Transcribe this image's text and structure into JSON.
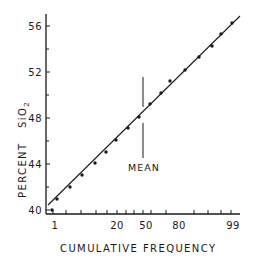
{
  "chart_data": {
    "type": "scatter",
    "title": "",
    "xlabel": "CUMULATIVE FREQUENCY",
    "ylabel": "PERCENT SiO2",
    "ylabel_main": "PERCENT",
    "ylabel_chem": "SiO",
    "ylabel_sub": "2",
    "x_scale": "probability",
    "x_tick_labels": [
      "1",
      "20",
      "50",
      "80",
      "99"
    ],
    "y_tick_labels": [
      "40",
      "44",
      "48",
      "52",
      "56"
    ],
    "ylim": [
      39,
      57
    ],
    "xlim": [
      0.5,
      99.5
    ],
    "grid": false,
    "legend": null,
    "annotation": {
      "text": "MEAN",
      "x": 50
    },
    "series": [
      {
        "name": "samples",
        "marker": "dot",
        "x": [
          1,
          3,
          6,
          10,
          15,
          21,
          28,
          36,
          44,
          52,
          60,
          67,
          76,
          84,
          90,
          94,
          97.5
        ],
        "y": [
          40.0,
          41.0,
          42.0,
          43.0,
          44.1,
          45.0,
          46.0,
          47.1,
          48.0,
          49.1,
          50.1,
          51.1,
          52.1,
          53.2,
          54.2,
          55.2,
          56.1
        ]
      }
    ],
    "fit_line": {
      "from": {
        "x": 0.8,
        "y": 40.4
      },
      "to": {
        "x": 99,
        "y": 56.9
      }
    }
  },
  "points_px": [
    [
      52,
      210
    ],
    [
      57,
      199
    ],
    [
      70,
      187
    ],
    [
      82,
      175
    ],
    [
      95,
      163
    ],
    [
      106,
      152
    ],
    [
      116,
      140
    ],
    [
      128,
      128
    ],
    [
      139,
      117
    ],
    [
      150,
      104
    ],
    [
      161,
      93
    ],
    [
      170,
      81
    ],
    [
      185,
      70
    ],
    [
      199,
      57
    ],
    [
      212,
      46
    ],
    [
      221,
      34
    ],
    [
      232,
      23
    ]
  ],
  "y_ticks_px": [
    {
      "label": "40",
      "y": 210
    },
    {
      "label": "44",
      "y": 174
    },
    {
      "label": "48",
      "y": 117
    },
    {
      "label": "52",
      "y": 72
    },
    {
      "label": "56",
      "y": 26
    }
  ],
  "x_ticks_px": [
    {
      "label": "1",
      "x": 53
    },
    {
      "label": "20",
      "x": 117
    },
    {
      "label": "50",
      "x": 143
    },
    {
      "label": "80",
      "x": 166
    },
    {
      "label": "99",
      "x": 231
    }
  ],
  "colors": {
    "ink": "#1a1a1a",
    "background": "#ffffff"
  }
}
